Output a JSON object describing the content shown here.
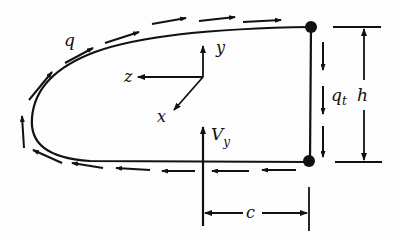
{
  "diagram": {
    "title": "",
    "colors": {
      "ink": "#111111",
      "background": "#fdfdfd"
    },
    "labels": {
      "shear_flow_skin": "q",
      "shear_flow_web": "q",
      "shear_flow_web_subscript": "t",
      "height": "h",
      "offset": "c",
      "axis_x": "x",
      "axis_y": "y",
      "axis_z": "z",
      "shear_force": "V",
      "shear_force_subscript": "y"
    },
    "elements": [
      {
        "id": "skin-contour",
        "type": "curve",
        "note": "closed nose contour from top-right corner around leading edge to bottom-right corner"
      },
      {
        "id": "web",
        "type": "line",
        "note": "vertical web between two boom dots"
      },
      {
        "id": "booms",
        "type": "points",
        "count": 2
      },
      {
        "id": "shear-flow-arrows-skin",
        "type": "dashed-arrows",
        "direction": "counter-clockwise from bottom, over nose, to top right"
      },
      {
        "id": "shear-flow-arrows-web",
        "type": "arrows",
        "count": 3,
        "direction": "down"
      },
      {
        "id": "height-dimension",
        "type": "dimension",
        "label": "h"
      },
      {
        "id": "offset-dimension",
        "type": "dimension",
        "label": "c"
      },
      {
        "id": "axes",
        "type": "coordinate-system",
        "axes": [
          "x",
          "y",
          "z"
        ]
      },
      {
        "id": "shear-load",
        "type": "arrow",
        "label": "Vy",
        "direction": "up"
      }
    ]
  }
}
